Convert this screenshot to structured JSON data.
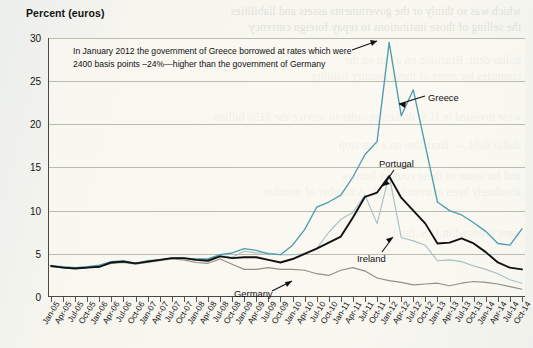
{
  "figure": {
    "axis_title": "Percent (euros)",
    "annotation_line1": "In January 2012 the government of Greece borrowed at rates which were",
    "annotation_line2": "2400 basis points –24%—higher than the government of Germany"
  },
  "labels": {
    "greece": "Greece",
    "portugal": "Portugal",
    "ireland": "Ireland",
    "germany": "Germany"
  },
  "colors": {
    "greece": "#4e9cb0",
    "portugal": "#111111",
    "ireland": "#a9bfc4",
    "germany": "#8e9184",
    "grid": "#b9bdae",
    "axis": "#4a4a44",
    "paper": "#f6f4ed"
  },
  "chart_data": {
    "type": "line",
    "title": "Percent (euros)",
    "xlabel": "",
    "ylabel": "Percent (euros)",
    "ylim": [
      0,
      30
    ],
    "yticks": [
      0,
      5,
      10,
      15,
      20,
      25,
      30
    ],
    "grid": true,
    "legend": "inline-annotations",
    "annotations": [
      "In January 2012 the government of Greece borrowed at rates which were 2400 basis points –24%—higher than the government of Germany"
    ],
    "categories": [
      "Jan-05",
      "Apr-05",
      "Jul-05",
      "Oct-05",
      "Jan-06",
      "Apr-06",
      "Jul-06",
      "Oct-06",
      "Jan-07",
      "Apr-07",
      "Jul-07",
      "Oct-07",
      "Jan-08",
      "Apr-08",
      "Jul-08",
      "Oct-08",
      "Jan-09",
      "Apr-09",
      "Jul-09",
      "Oct-09",
      "Jan-10",
      "Apr-10",
      "Jul-10",
      "Oct-10",
      "Jan-11",
      "Apr-11",
      "Jul-11",
      "Oct-11",
      "Jan-12",
      "Apr-12",
      "Jul-12",
      "Oct-12",
      "Jan-13",
      "Apr-13",
      "Jul-13",
      "Oct-13",
      "Jan-14",
      "Apr-14",
      "Jul-14",
      "Oct-14"
    ],
    "series": [
      {
        "name": "Greece",
        "color": "#4e9cb0",
        "values": [
          3.6,
          3.5,
          3.4,
          3.5,
          3.7,
          4.1,
          4.2,
          3.9,
          4.2,
          4.3,
          4.5,
          4.5,
          4.4,
          4.4,
          4.9,
          5.1,
          5.6,
          5.4,
          5.0,
          4.9,
          6.0,
          7.8,
          10.4,
          11.0,
          11.8,
          13.9,
          16.5,
          18.0,
          29.5,
          21.0,
          24.0,
          17.5,
          11.0,
          10.0,
          9.5,
          8.6,
          7.6,
          6.2,
          6.0,
          7.9
        ]
      },
      {
        "name": "Portugal",
        "color": "#111111",
        "values": [
          3.6,
          3.4,
          3.3,
          3.4,
          3.5,
          4.0,
          4.1,
          3.9,
          4.1,
          4.3,
          4.5,
          4.5,
          4.3,
          4.2,
          4.7,
          4.5,
          4.6,
          4.6,
          4.3,
          4.0,
          4.4,
          5.0,
          5.6,
          6.3,
          7.0,
          9.2,
          11.6,
          12.1,
          14.0,
          11.5,
          10.0,
          8.5,
          6.2,
          6.3,
          6.8,
          6.2,
          5.2,
          4.0,
          3.4,
          3.2
        ]
      },
      {
        "name": "Ireland",
        "color": "#a9bfc4",
        "values": [
          3.5,
          3.4,
          3.3,
          3.4,
          3.5,
          4.0,
          4.1,
          3.9,
          4.1,
          4.3,
          4.5,
          4.5,
          4.3,
          4.4,
          4.8,
          4.6,
          5.3,
          5.1,
          5.1,
          4.9,
          4.9,
          5.0,
          5.6,
          7.5,
          9.0,
          9.8,
          11.8,
          8.5,
          14.1,
          6.9,
          6.5,
          6.0,
          4.2,
          4.3,
          4.1,
          3.6,
          3.2,
          2.7,
          2.0,
          1.6
        ]
      },
      {
        "name": "Germany",
        "color": "#8e9184",
        "values": [
          3.5,
          3.4,
          3.3,
          3.4,
          3.5,
          3.9,
          4.0,
          3.8,
          4.0,
          4.2,
          4.4,
          4.3,
          4.0,
          3.9,
          4.4,
          3.8,
          3.2,
          3.2,
          3.4,
          3.2,
          3.2,
          3.1,
          2.7,
          2.5,
          3.1,
          3.4,
          3.0,
          2.2,
          1.9,
          1.7,
          1.4,
          1.5,
          1.6,
          1.3,
          1.6,
          1.8,
          1.7,
          1.5,
          1.2,
          0.9
        ]
      }
    ]
  },
  "ghost_text": [
    "which was so thinly or the governments assets and liabilities",
    "the selling of those institutions to repay foreign currency",
    "dollars in order to service the $150 billion",
    "dollar debt. Brazilian on a run on the",
    "",
    "countries for some of these country liability",
    "As a result, some a 4 the risk of these countries borrow their",
    "Argentina have been absolutely been extremely high. A number of member",
    "",
    "were invested in U.S. dollars in order to service the U.S. fund"
  ]
}
